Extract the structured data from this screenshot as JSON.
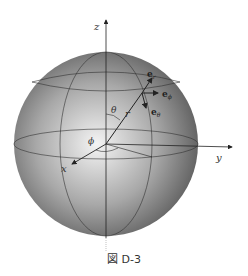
{
  "figure": {
    "caption": "図 D-3",
    "axes": {
      "x": "x",
      "y": "y",
      "z": "z"
    },
    "angles": {
      "theta": "θ",
      "phi": "ϕ"
    },
    "radius_label": "r",
    "unit_vectors": {
      "e_r": "e",
      "e_r_sub": "r",
      "e_phi": "e",
      "e_phi_sub": "ϕ",
      "e_theta": "e",
      "e_theta_sub": "θ"
    },
    "colors": {
      "sphere_light": "#f2f2f2",
      "sphere_dark": "#5a5a5a",
      "lines": "#222222"
    }
  }
}
